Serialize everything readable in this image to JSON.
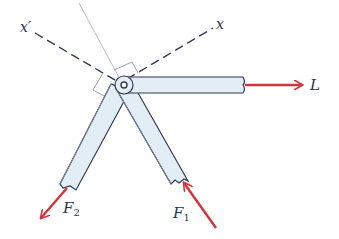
{
  "diagram": {
    "type": "free-body diagram of pinned links",
    "labels": {
      "x_prime": "x′",
      "x": "x",
      "L": "L",
      "F1": "F",
      "F1_sub": "1",
      "F2": "F",
      "F2_sub": "2"
    },
    "colors": {
      "member_fill": "#e3edf6",
      "member_stroke": "#2e3a55",
      "member_stroke_light": "#7b8699",
      "force_arrow": "#d2343a",
      "axis_dashed": "#2e3a55",
      "guide_line": "#b7bcc6",
      "label_text": "#2a3550"
    },
    "elements": [
      "horizontal link to right with force L",
      "link down-left with force F2",
      "link down-right with force F1 pushing up-left",
      "pin joint with small circle",
      "dashed x and x′ axes",
      "faint reference line and right-angle marks"
    ]
  }
}
